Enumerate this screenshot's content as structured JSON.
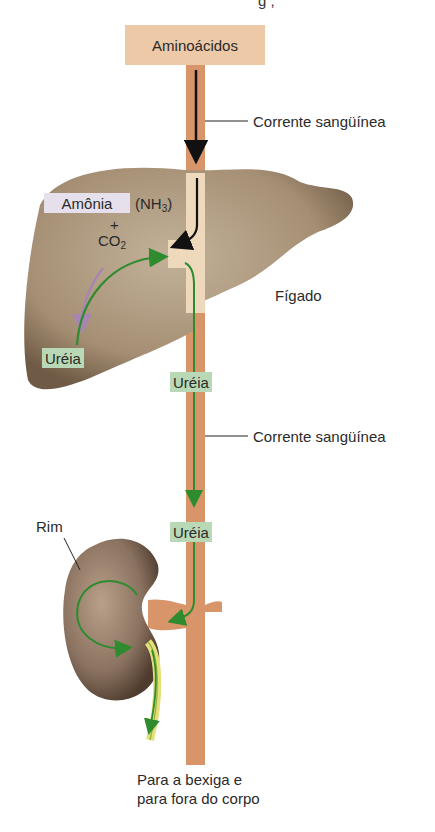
{
  "title_fragment": "g ,",
  "labels": {
    "aminoacids": "Aminoácidos",
    "bloodstream_top": "Corrente sangüínea",
    "ammonia": "Amônia",
    "nh3_prefix": "(NH",
    "nh3_sub": "3",
    "nh3_suffix": ")",
    "plus": "+",
    "co2_prefix": "CO",
    "co2_sub": "2",
    "liver": "Fígado",
    "urea_liver": "Uréia",
    "urea_vessel_1": "Uréia",
    "bloodstream_bottom": "Corrente sangüínea",
    "urea_vessel_2": "Uréia",
    "kidney": "Rim",
    "exit_line1": "Para a bexiga e",
    "exit_line2": "para fora do corpo"
  },
  "colors": {
    "vessel": "#d9956a",
    "vessel_in_liver": "#efd9bd",
    "liver": "#a6937a",
    "kidney": "#8a7260",
    "amino_box": "#edc9a7",
    "ammonia_tag": "#e6e0ec",
    "urea_tag": "#b9d9b6",
    "arrow_black": "#111111",
    "arrow_green": "#2e8b2e",
    "arrow_purple": "#a884b4",
    "ureter": "#e3e07a"
  },
  "flow": [
    {
      "from": "Aminoácidos",
      "to": "Fígado",
      "via": "Corrente sangüínea"
    },
    {
      "from": "Amônia (NH3) + CO2",
      "to": "Uréia",
      "in": "Fígado"
    },
    {
      "from": "Fígado",
      "to": "Rim",
      "carries": "Uréia",
      "via": "Corrente sangüínea"
    },
    {
      "from": "Rim",
      "to": "Para a bexiga e para fora do corpo"
    }
  ]
}
